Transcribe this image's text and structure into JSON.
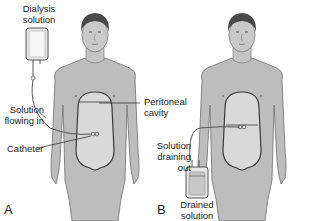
{
  "figure": {
    "topic": "Peritoneal dialysis",
    "panels": [
      {
        "id": "A",
        "label": "A",
        "labels": {
          "dialysis_solution_line1": "Dialysis",
          "dialysis_solution_line2": "solution",
          "solution_flowing_line1": "Solution",
          "solution_flowing_line2": "flowing in",
          "catheter": "Catheter",
          "peritoneal_line1": "Peritoneal",
          "peritoneal_line2": "cavity"
        }
      },
      {
        "id": "B",
        "label": "B",
        "labels": {
          "draining_line1": "Solution",
          "draining_line2": "draining",
          "draining_line3": "out",
          "drained_line1": "Drained",
          "drained_line2": "solution"
        }
      }
    ],
    "colors": {
      "skin": "#bdbdbd",
      "skin_outline": "#6e6e6e",
      "cavity_fill": "#d9d9d9",
      "cavity_outline": "#3a3a3a",
      "hair": "#4a4a4a",
      "bag_fill": "#e8e8e8",
      "drained_fill": "#c8c8c8",
      "text": "#1a1a1a"
    }
  }
}
